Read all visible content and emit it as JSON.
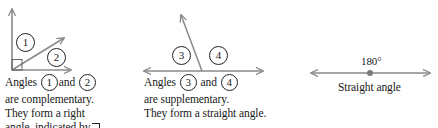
{
  "figures": [
    {
      "id": "complementary",
      "angle_labels": [
        "1",
        "2"
      ],
      "caption": {
        "line1_prefix": "Angles",
        "line1_and": "and",
        "line2": "are complementary.",
        "line3": "They form a right",
        "line4_text": "angle, indicated by",
        "line4_suffix": "."
      }
    },
    {
      "id": "supplementary",
      "angle_labels": [
        "3",
        "4"
      ],
      "caption": {
        "line1_prefix": "Angles",
        "line1_and": "and",
        "line2": "are supplementary.",
        "line3": "They form a straight angle."
      }
    },
    {
      "id": "straight-angle",
      "measure_label": "180°",
      "caption": "Straight angle"
    }
  ],
  "colors": {
    "line": "#8a8a8a",
    "text": "#1a1a1a",
    "background": "#ffffff"
  }
}
